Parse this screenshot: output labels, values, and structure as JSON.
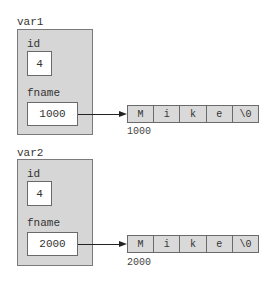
{
  "variables": [
    {
      "name": "var1",
      "fields": {
        "id": {
          "label": "id",
          "value": "4"
        },
        "fname": {
          "label": "fname",
          "value": "1000"
        }
      },
      "string": {
        "address": "1000",
        "chars": [
          "M",
          "i",
          "k",
          "e",
          "\\0"
        ]
      }
    },
    {
      "name": "var2",
      "fields": {
        "id": {
          "label": "id",
          "value": "4"
        },
        "fname": {
          "label": "fname",
          "value": "2000"
        }
      },
      "string": {
        "address": "2000",
        "chars": [
          "M",
          "i",
          "k",
          "e",
          "\\0"
        ]
      }
    }
  ],
  "colors": {
    "struct_fill": "#d6d6d6",
    "array_fill": "#d9d9d9",
    "value_fill": "#ffffff",
    "border": "#6a6a6a",
    "arrow": "#222222"
  }
}
